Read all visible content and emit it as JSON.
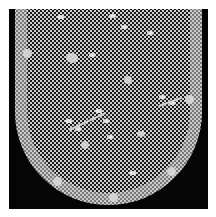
{
  "image": {
    "alt": "Photograph of a white bobbin lace lappet with floral sprigs on a hexagonal net ground, rounded scalloped end, against a black background",
    "background_color": "#050505",
    "lace_color": "#d8d8d8",
    "margin_color": "#ffffff"
  }
}
